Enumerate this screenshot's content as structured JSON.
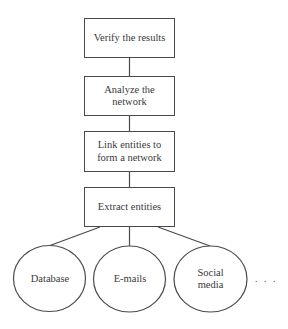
{
  "diagram": {
    "type": "flowchart",
    "direction": "bottom-to-top",
    "steps": [
      {
        "id": "verify",
        "label": "Verify the results"
      },
      {
        "id": "analyze",
        "label": "Analyze the network"
      },
      {
        "id": "link",
        "label": "Link entities to form a network"
      },
      {
        "id": "extract",
        "label": "Extract entities"
      }
    ],
    "sources": [
      {
        "id": "database",
        "label": "Database"
      },
      {
        "id": "emails",
        "label": "E-mails"
      },
      {
        "id": "social",
        "label": "Social media"
      }
    ],
    "more_indicator": ". . .",
    "edges": [
      {
        "from": "database",
        "to": "extract"
      },
      {
        "from": "emails",
        "to": "extract"
      },
      {
        "from": "social",
        "to": "extract"
      },
      {
        "from": "extract",
        "to": "link"
      },
      {
        "from": "link",
        "to": "analyze"
      },
      {
        "from": "analyze",
        "to": "verify"
      }
    ],
    "colors": {
      "stroke": "#4a4a4a",
      "text": "#3a3a3a",
      "background": "#ffffff"
    }
  }
}
